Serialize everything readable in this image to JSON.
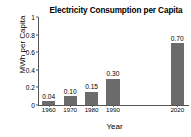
{
  "chart_data": {
    "type": "bar",
    "title": "Electricity Consumption per Capita",
    "xlabel": "Year",
    "ylabel": "MWh per Capita",
    "categories": [
      "1960",
      "1970",
      "1980",
      "1990",
      "2000",
      "2010",
      "2020"
    ],
    "values": [
      0.04,
      0.1,
      0.15,
      0.3,
      null,
      null,
      0.7
    ],
    "value_labels": [
      "0.04",
      "0.10",
      "0.15",
      "0.30",
      "",
      "",
      "0.70"
    ],
    "visible_categories": [
      "1960",
      "1970",
      "1980",
      "1990",
      "2020"
    ],
    "ylim": [
      0,
      1
    ],
    "yticks": [
      0,
      0.2,
      0.4,
      0.6,
      0.8,
      1
    ],
    "ytick_labels": [
      "0",
      "0.2",
      "0.4",
      "0.6",
      "0.8",
      "1"
    ],
    "grid": false,
    "legend": false,
    "bar_color": "#6b6b6b",
    "axis_color": "#555555",
    "background": "#ffffff"
  }
}
